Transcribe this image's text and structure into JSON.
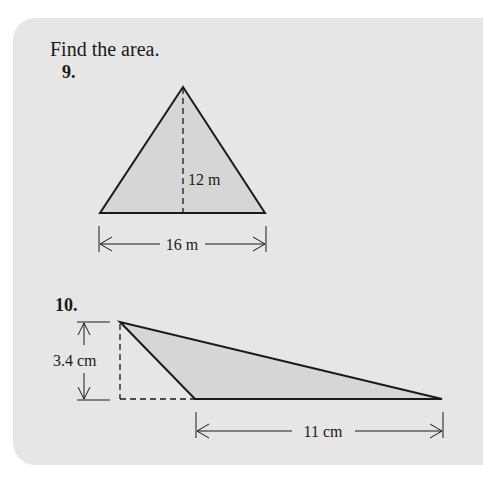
{
  "instruction": "Find the area.",
  "problems": [
    {
      "number": "9.",
      "shape": "triangle",
      "height_label": "12 m",
      "base_label": "16 m"
    },
    {
      "number": "10.",
      "shape": "obtuse-triangle",
      "height_label": "3.4 cm",
      "base_label": "11 cm"
    }
  ],
  "colors": {
    "panel": "#e6e6e6",
    "fill": "#d6d6d6",
    "stroke": "#1a1a1a"
  }
}
